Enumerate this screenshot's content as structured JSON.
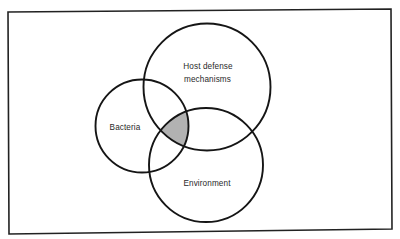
{
  "diagram": {
    "type": "venn",
    "frame": {
      "points": [
        [
          8,
          12
        ],
        [
          391,
          9
        ],
        [
          392,
          229
        ],
        [
          9,
          234
        ]
      ],
      "stroke": "#222222",
      "stroke_width": 1.6
    },
    "circles": [
      {
        "id": "host",
        "label_lines": [
          "Host defense",
          "mechanisms"
        ],
        "cx": 207,
        "cy": 87,
        "r": 63.5
      },
      {
        "id": "bacteria",
        "label_lines": [
          "Bacteria"
        ],
        "cx": 142,
        "cy": 126,
        "r": 46.5
      },
      {
        "id": "environment",
        "label_lines": [
          "Environment"
        ],
        "cx": 206,
        "cy": 165,
        "r": 57
      }
    ],
    "circle_stroke": "#151515",
    "circle_stroke_width": 1.9,
    "intersection": {
      "description": "Overlap of Bacteria, Host defense mechanisms and Environment",
      "fill": "#b2b2b2"
    },
    "labels": {
      "host_line1": "Host defense",
      "host_line2": "mechanisms",
      "bacteria": "Bacteria",
      "environment": "Environment"
    }
  }
}
